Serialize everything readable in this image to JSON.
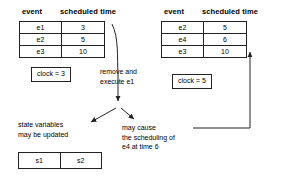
{
  "diagram": {
    "left_table": {
      "headers": {
        "event": "event",
        "time": "scheduled time"
      },
      "rows": [
        {
          "event": "e1",
          "time": "3"
        },
        {
          "event": "e2",
          "time": "5"
        },
        {
          "event": "e3",
          "time": "10"
        }
      ]
    },
    "right_table": {
      "headers": {
        "event": "event",
        "time": "scheduled time"
      },
      "rows": [
        {
          "event": "e2",
          "time": "5"
        },
        {
          "event": "e4",
          "time": "6"
        },
        {
          "event": "e3",
          "time": "10"
        }
      ]
    },
    "left_clock": "clock = 3",
    "right_clock": "clock = 5",
    "notes": {
      "remove_execute": "remove and\nexecute e1",
      "state_variables": "state variables\nmay be updated",
      "may_cause": "may cause\nthe scheduling of\ne4 at time 6"
    },
    "state_box": {
      "cells": [
        "s1",
        "s2"
      ]
    },
    "colors": {
      "stroke": "#222222",
      "text": "#000000",
      "background": "#ffffff"
    }
  }
}
